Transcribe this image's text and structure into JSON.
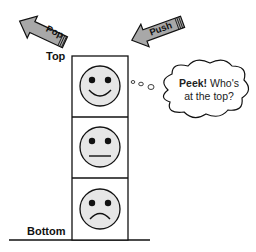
{
  "diagram": {
    "labels": {
      "top": "Top",
      "bottom": "Bottom"
    },
    "arrows": [
      {
        "name": "pop",
        "label": "Pop",
        "direction": "out"
      },
      {
        "name": "push",
        "label": "Push",
        "direction": "in"
      }
    ],
    "cloud": {
      "bold": "Peek!",
      "text_line1": " Who's",
      "text_line2": "at the top?"
    },
    "stack_items": [
      {
        "position": "top",
        "face": "smile"
      },
      {
        "position": "middle",
        "face": "neutral"
      },
      {
        "position": "bottom",
        "face": "frown"
      }
    ],
    "colors": {
      "arrow_fill": "#a8a8a8",
      "face_fill": "#e6e6e6",
      "outline": "#111111"
    }
  }
}
